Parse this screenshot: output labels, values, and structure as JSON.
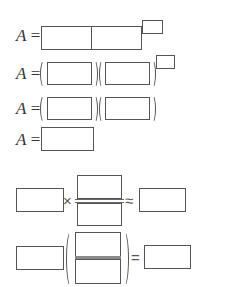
{
  "rows": [
    {
      "label_var": "A",
      "label_eq": " ="
    },
    {
      "label_var": "A",
      "label_eq": " ="
    },
    {
      "label_var": "A",
      "label_eq": " ="
    },
    {
      "label_var": "A",
      "label_eq": " ="
    }
  ],
  "operators": {
    "times": "×",
    "approx": "≈",
    "equals": "="
  }
}
